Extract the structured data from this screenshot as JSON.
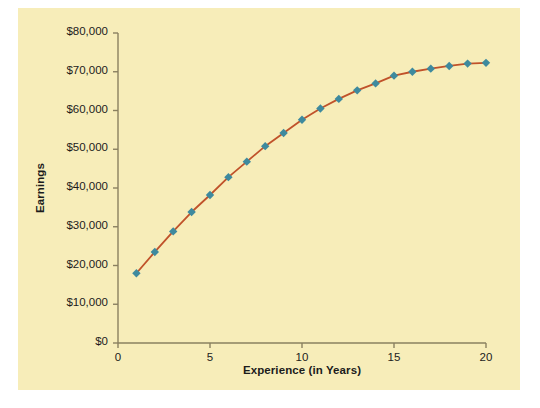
{
  "chart_data": {
    "type": "line",
    "title": "",
    "xlabel": "Experience (in Years)",
    "ylabel": "Earnings",
    "xlim": [
      0,
      20
    ],
    "ylim": [
      0,
      80000
    ],
    "grid": false,
    "legend": "none",
    "x_ticks": [
      {
        "value": 0,
        "label": "0"
      },
      {
        "value": 5,
        "label": "5"
      },
      {
        "value": 10,
        "label": "10"
      },
      {
        "value": 15,
        "label": "15"
      },
      {
        "value": 20,
        "label": "20"
      }
    ],
    "y_ticks": [
      {
        "value": 0,
        "label": "$0"
      },
      {
        "value": 10000,
        "label": "$10,000"
      },
      {
        "value": 20000,
        "label": "$20,000"
      },
      {
        "value": 30000,
        "label": "$30,000"
      },
      {
        "value": 40000,
        "label": "$40,000"
      },
      {
        "value": 50000,
        "label": "$50,000"
      },
      {
        "value": 60000,
        "label": "$60,000"
      },
      {
        "value": 70000,
        "label": "$70,000"
      },
      {
        "value": 80000,
        "label": "$80,000"
      }
    ],
    "series": [
      {
        "name": "Earnings",
        "line_color": "#c0522a",
        "marker_color": "#3e8a9e",
        "marker": "diamond",
        "x": [
          1,
          2,
          3,
          4,
          5,
          6,
          7,
          8,
          9,
          10,
          11,
          12,
          13,
          14,
          15,
          16,
          17,
          18,
          19,
          20
        ],
        "values": [
          18000,
          23500,
          28800,
          33800,
          38200,
          42800,
          46800,
          50800,
          54200,
          57600,
          60500,
          63000,
          65200,
          67000,
          69000,
          70000,
          70800,
          71500,
          72100,
          72300
        ]
      }
    ]
  },
  "figure": {
    "panel_color": "#f7edb9",
    "background_color": "#ffffff",
    "axis_color": "#8a8060"
  }
}
